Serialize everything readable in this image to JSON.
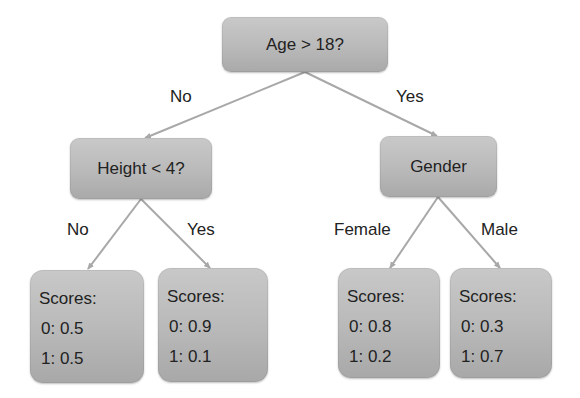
{
  "diagram": {
    "type": "decision-tree",
    "colors": {
      "node_fill": "#bcbcbc",
      "edge": "#a8a8a8",
      "text": "#222222",
      "background": "#ffffff"
    },
    "root": {
      "label": "Age > 18?",
      "edges": {
        "left": "No",
        "right": "Yes"
      }
    },
    "left_node": {
      "label": "Height < 4?",
      "edges": {
        "left": "No",
        "right": "Yes"
      }
    },
    "right_node": {
      "label": "Gender",
      "edges": {
        "left": "Female",
        "right": "Male"
      }
    },
    "leaves": [
      {
        "title": "Scores:",
        "score0": "0: 0.5",
        "score1": "1: 0.5"
      },
      {
        "title": "Scores:",
        "score0": "0: 0.9",
        "score1": "1: 0.1"
      },
      {
        "title": "Scores:",
        "score0": "0: 0.8",
        "score1": "1: 0.2"
      },
      {
        "title": "Scores:",
        "score0": "0: 0.3",
        "score1": "1: 0.7"
      }
    ]
  }
}
